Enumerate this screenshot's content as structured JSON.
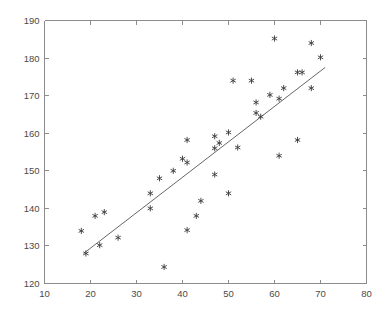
{
  "chart_data": {
    "type": "scatter",
    "title": "",
    "xlabel": "",
    "ylabel": "",
    "xlim": [
      10,
      80
    ],
    "ylim": [
      120,
      190
    ],
    "xticks": [
      10,
      20,
      30,
      40,
      50,
      60,
      70,
      80
    ],
    "yticks": [
      120,
      130,
      140,
      150,
      160,
      170,
      180,
      190
    ],
    "grid": false,
    "legend": "none",
    "marker_style": "asterisk",
    "marker_color": "#3a3a3a",
    "series": [
      {
        "name": "observations",
        "type": "scatter",
        "points": [
          [
            18,
            134.0
          ],
          [
            19,
            128.0
          ],
          [
            21,
            138.0
          ],
          [
            22,
            130.2
          ],
          [
            23,
            139.0
          ],
          [
            26,
            132.2
          ],
          [
            33,
            144.0
          ],
          [
            33,
            140.0
          ],
          [
            35,
            148.0
          ],
          [
            36,
            124.4
          ],
          [
            38,
            150.0
          ],
          [
            40,
            153.2
          ],
          [
            41,
            158.2
          ],
          [
            41,
            152.2
          ],
          [
            41,
            134.2
          ],
          [
            43,
            138.0
          ],
          [
            44,
            142.0
          ],
          [
            47,
            159.2
          ],
          [
            47,
            156.0
          ],
          [
            47,
            149.0
          ],
          [
            48,
            157.4
          ],
          [
            50,
            160.2
          ],
          [
            50,
            144.0
          ],
          [
            51,
            174.0
          ],
          [
            52,
            156.2
          ],
          [
            55,
            174.0
          ],
          [
            56,
            165.4
          ],
          [
            56,
            168.2
          ],
          [
            57,
            164.4
          ],
          [
            59,
            170.2
          ],
          [
            60,
            185.2
          ],
          [
            61,
            169.2
          ],
          [
            61,
            154.0
          ],
          [
            62,
            172.0
          ],
          [
            65,
            176.2
          ],
          [
            65,
            158.2
          ],
          [
            66,
            176.2
          ],
          [
            68,
            184.0
          ],
          [
            68,
            172.0
          ],
          [
            70,
            180.2
          ]
        ]
      },
      {
        "name": "fitted-line",
        "type": "line",
        "points": [
          [
            18.5,
            128.0
          ],
          [
            71.0,
            177.5
          ]
        ]
      }
    ]
  },
  "axes": {
    "x_tick_labels": [
      "10",
      "20",
      "30",
      "40",
      "50",
      "60",
      "70",
      "80"
    ],
    "y_tick_labels": [
      "120",
      "130",
      "140",
      "150",
      "160",
      "170",
      "180",
      "190"
    ]
  }
}
